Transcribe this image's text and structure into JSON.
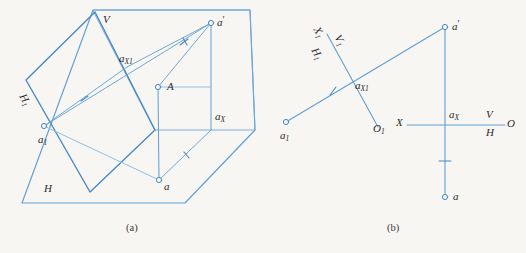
{
  "figure": {
    "background_color": "#f7f6f2",
    "line_color": "#6ea8d8",
    "line_color_dark": "#4a87c4",
    "text_color": "#2b2b2b",
    "captions": [
      {
        "key": "a",
        "text": "(a)"
      },
      {
        "key": "b",
        "text": "(b)"
      }
    ]
  },
  "panel_a": {
    "name": "pictorial-view",
    "labels": {
      "v_plane": "V",
      "h_plane": "H",
      "h1_plane": "H",
      "h1_plane_sub": "1",
      "point_A": "A",
      "point_a_prime": "a",
      "point_a_prime_sup": "′",
      "point_a": "a",
      "point_a1": "a",
      "point_a1_sub": "1",
      "point_ax": "a",
      "point_ax_sub": "X",
      "point_ax1": "a",
      "point_ax1_sub": "X1"
    }
  },
  "panel_b": {
    "name": "orthographic-projection",
    "labels": {
      "axis_X": "X",
      "axis_O": "O",
      "axis_V": "V",
      "axis_H": "H",
      "axis_X1": "X",
      "axis_X1_sub": "1",
      "axis_V1": "V",
      "axis_V1_sub": "1",
      "axis_H1": "H",
      "axis_H1_sub": "1",
      "axis_O1": "O",
      "axis_O1_sub": "1",
      "point_a_prime": "a",
      "point_a_prime_sup": "′",
      "point_a": "a",
      "point_a1": "a",
      "point_a1_sub": "1",
      "point_ax": "a",
      "point_ax_sub": "X",
      "point_ax1": "a",
      "point_ax1_sub": "X1"
    }
  }
}
